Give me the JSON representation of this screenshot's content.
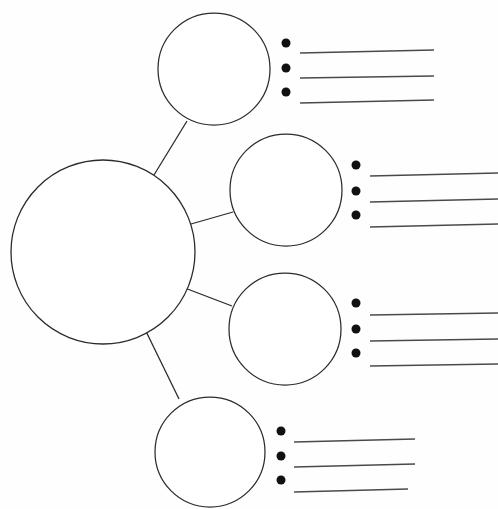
{
  "document": {
    "title": "Concept Map Graphic Organizer",
    "page_width": 498,
    "page_height": 509,
    "background_color": "#fefefe",
    "ink_color": "#2b2b2b",
    "line_color": "#4a4a4a",
    "bullet_color": "#111111"
  },
  "center_node": {
    "name": "main-topic-circle",
    "label": "",
    "cx": 103,
    "cy": 252,
    "r": 92
  },
  "branches": [
    {
      "id": "branch-1",
      "node": {
        "name": "subtopic-circle-1",
        "label": "",
        "cx": 214,
        "cy": 69,
        "r": 56
      },
      "connector": {
        "x1": 143,
        "y1": 193,
        "x2": 187,
        "y2": 121
      },
      "bullets": [
        {
          "cx": 286,
          "cy": 43,
          "r": 4.5,
          "line": {
            "x1": 300,
            "y1": 53,
            "x2": 434,
            "y2": 50
          }
        },
        {
          "cx": 286,
          "cy": 68,
          "r": 4.5,
          "line": {
            "x1": 300,
            "y1": 78,
            "x2": 434,
            "y2": 76
          }
        },
        {
          "cx": 286,
          "cy": 92,
          "r": 4.5,
          "line": {
            "x1": 300,
            "y1": 103,
            "x2": 434,
            "y2": 100
          }
        }
      ]
    },
    {
      "id": "branch-2",
      "node": {
        "name": "subtopic-circle-2",
        "label": "",
        "cx": 286,
        "cy": 190,
        "r": 56
      },
      "connector": {
        "x1": 170,
        "y1": 230,
        "x2": 233,
        "y2": 212
      },
      "bullets": [
        {
          "cx": 356,
          "cy": 165,
          "r": 4.5,
          "line": {
            "x1": 370,
            "y1": 176,
            "x2": 498,
            "y2": 173
          }
        },
        {
          "cx": 356,
          "cy": 191,
          "r": 4.5,
          "line": {
            "x1": 370,
            "y1": 202,
            "x2": 498,
            "y2": 199
          }
        },
        {
          "cx": 356,
          "cy": 215,
          "r": 4.5,
          "line": {
            "x1": 370,
            "y1": 227,
            "x2": 498,
            "y2": 224
          }
        }
      ]
    },
    {
      "id": "branch-3",
      "node": {
        "name": "subtopic-circle-3",
        "label": "",
        "cx": 285,
        "cy": 329,
        "r": 56
      },
      "connector": {
        "x1": 169,
        "y1": 282,
        "x2": 232,
        "y2": 306
      },
      "bullets": [
        {
          "cx": 356,
          "cy": 303,
          "r": 4.5,
          "line": {
            "x1": 370,
            "y1": 315,
            "x2": 498,
            "y2": 313
          }
        },
        {
          "cx": 356,
          "cy": 329,
          "r": 4.5,
          "line": {
            "x1": 370,
            "y1": 341,
            "x2": 498,
            "y2": 339
          }
        },
        {
          "cx": 356,
          "cy": 353,
          "r": 4.5,
          "line": {
            "x1": 370,
            "y1": 366,
            "x2": 498,
            "y2": 364
          }
        }
      ]
    },
    {
      "id": "branch-4",
      "node": {
        "name": "subtopic-circle-4",
        "label": "",
        "cx": 210,
        "cy": 452,
        "r": 55
      },
      "connector": {
        "x1": 139,
        "y1": 317,
        "x2": 179,
        "y2": 399
      },
      "bullets": [
        {
          "cx": 281,
          "cy": 431,
          "r": 4.5,
          "line": {
            "x1": 294,
            "y1": 442,
            "x2": 415,
            "y2": 439
          }
        },
        {
          "cx": 281,
          "cy": 456,
          "r": 4.5,
          "line": {
            "x1": 294,
            "y1": 467,
            "x2": 415,
            "y2": 464
          }
        },
        {
          "cx": 281,
          "cy": 480,
          "r": 4.5,
          "line": {
            "x1": 294,
            "y1": 492,
            "x2": 408,
            "y2": 489
          }
        }
      ]
    }
  ]
}
